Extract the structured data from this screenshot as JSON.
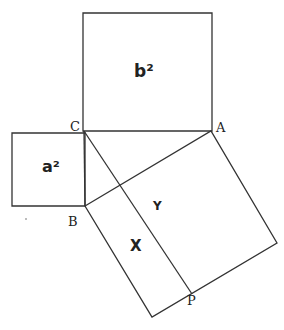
{
  "diagram": {
    "stroke_color": "#333333",
    "squares": {
      "b_square": {
        "label": "b²",
        "points": [
          [
            83,
            13
          ],
          [
            212,
            13
          ],
          [
            212,
            131
          ],
          [
            83,
            131
          ]
        ]
      },
      "a_square": {
        "label": "a²",
        "points": [
          [
            12,
            133
          ],
          [
            85,
            133
          ],
          [
            85,
            206
          ],
          [
            12,
            206
          ]
        ]
      },
      "hyp_square": {
        "points": [
          [
            85,
            206
          ],
          [
            211,
            131
          ],
          [
            277,
            243
          ],
          [
            152,
            317
          ]
        ]
      }
    },
    "lines": {
      "cp_line": [
        [
          84,
          131
        ],
        [
          192,
          294
        ]
      ],
      "cb_line": [
        [
          84,
          131
        ],
        [
          85,
          206
        ]
      ]
    },
    "vertices": {
      "C": {
        "label": "C",
        "x": 70,
        "y": 131
      },
      "A": {
        "label": "A",
        "x": 216,
        "y": 132
      },
      "B": {
        "label": "B",
        "x": 68,
        "y": 225
      },
      "P": {
        "label": "P",
        "x": 187,
        "y": 304
      }
    },
    "regions": {
      "X": {
        "label": "X",
        "x": 131,
        "y": 250
      },
      "Y": {
        "label": "Y",
        "x": 153,
        "y": 209
      }
    }
  }
}
